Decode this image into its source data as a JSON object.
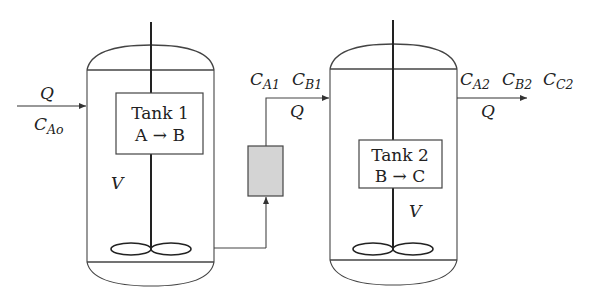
{
  "diagram": {
    "tank1": {
      "name": "Tank 1",
      "reaction": "A → B",
      "volume_label": "V"
    },
    "tank2": {
      "name": "Tank 2",
      "reaction": "B → C",
      "volume_label": "V"
    },
    "inlet": {
      "flow_label": "Q",
      "conc_main": "C",
      "conc_sub": "Ao"
    },
    "intermediate": {
      "flow_label": "Q",
      "c1_main": "C",
      "c1_sub": "A1",
      "c2_main": "C",
      "c2_sub": "B1"
    },
    "outlet": {
      "flow_label": "Q",
      "c1_main": "C",
      "c1_sub": "A2",
      "c2_main": "C",
      "c2_sub": "B2",
      "c3_main": "C",
      "c3_sub": "C2"
    },
    "colors": {
      "line": "#333333",
      "filter_fill": "#d4d4d4"
    }
  }
}
